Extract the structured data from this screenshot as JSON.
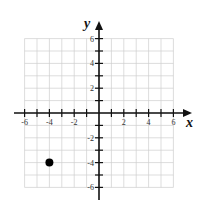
{
  "chart_data": {
    "type": "scatter",
    "title": "",
    "xlabel": "x",
    "ylabel": "y",
    "xlim": [
      -6,
      6
    ],
    "ylim": [
      -6,
      6
    ],
    "grid": true,
    "x_ticks": [
      -6,
      -4,
      -2,
      2,
      4,
      6
    ],
    "y_ticks": [
      6,
      4,
      2,
      -2,
      -4,
      -6
    ],
    "points": [
      {
        "x": -4,
        "y": -4
      }
    ]
  },
  "labels": {
    "x_axis": "x",
    "y_axis": "y",
    "xt": [
      "-6",
      "-4",
      "-2",
      "2",
      "4",
      "6"
    ],
    "yt": [
      "6",
      "4",
      "2",
      "-2",
      "-4",
      "-6"
    ]
  }
}
